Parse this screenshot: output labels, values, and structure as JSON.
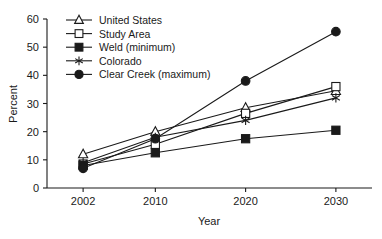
{
  "chart_data": {
    "type": "line",
    "title": "",
    "xlabel": "Year",
    "ylabel": "Percent",
    "x": [
      2002,
      2010,
      2020,
      2030
    ],
    "categories": [
      "2002",
      "2010",
      "2020",
      "2030"
    ],
    "xlim": [
      1998,
      2034
    ],
    "ylim": [
      0,
      60
    ],
    "yticks": [
      0,
      10,
      20,
      30,
      40,
      50,
      60
    ],
    "ytick_labels": [
      "0",
      "10",
      "20",
      "30",
      "40",
      "50",
      "60"
    ],
    "xtick_labels": [
      "2002",
      "2010",
      "2020",
      "2030"
    ],
    "grid": false,
    "legend_position": "top-left-inside",
    "series": [
      {
        "name": "United States",
        "marker": "open-triangle",
        "values": [
          12.0,
          20.0,
          28.5,
          34.5
        ]
      },
      {
        "name": "Study Area",
        "marker": "open-square",
        "values": [
          8.5,
          15.5,
          26.5,
          36.0
        ]
      },
      {
        "name": "Weld (minimum)",
        "marker": "filled-square",
        "values": [
          8.0,
          12.5,
          17.5,
          20.5
        ]
      },
      {
        "name": "Colorado",
        "marker": "asterisk",
        "values": [
          9.0,
          18.0,
          24.0,
          32.0
        ]
      },
      {
        "name": "Clear Creek  (maximum)",
        "marker": "filled-circle",
        "values": [
          7.0,
          17.5,
          38.0,
          55.5
        ]
      }
    ]
  },
  "axes": {
    "y_axis_title": "Percent",
    "x_axis_title": "Year"
  },
  "legend": {
    "entries": [
      {
        "label": "United States",
        "marker": "open-triangle"
      },
      {
        "label": "Study Area",
        "marker": "open-square"
      },
      {
        "label": "Weld (minimum)",
        "marker": "filled-square"
      },
      {
        "label": "Colorado",
        "marker": "asterisk"
      },
      {
        "label": "Clear Creek  (maximum)",
        "marker": "filled-circle"
      }
    ]
  },
  "colors": {
    "ink": "#1a1a1a",
    "background": "#ffffff",
    "marker_fill_open": "#ffffff"
  }
}
